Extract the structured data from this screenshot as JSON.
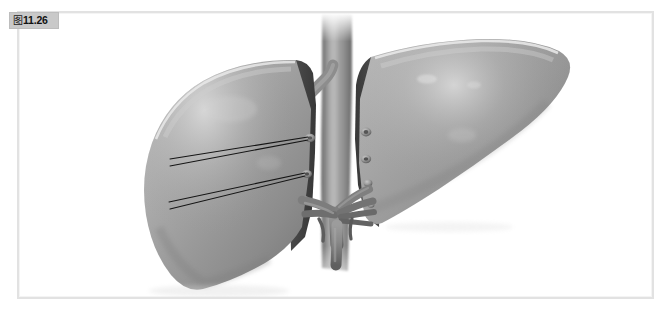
{
  "figure": {
    "badge_glyph": "图",
    "badge_number": "11.26",
    "badge_full": "图11.26",
    "caption": ""
  },
  "frame": {
    "border_color": "#e2e2e2",
    "background": "#ffffff",
    "badge_background": "#c9c9c9",
    "badge_text_color": "#111111"
  },
  "illustration": {
    "title": "bisected-liver-anatomy",
    "subject": "liver",
    "view": "bisected-posterior-view",
    "style": "grayscale-medical-illustration",
    "parts": [
      {
        "id": "left-lobe",
        "label": "left hepatic lobe",
        "tone": "#9b9b9b"
      },
      {
        "id": "right-lobe",
        "label": "right hepatic lobe",
        "tone": "#9b9b9b"
      },
      {
        "id": "left-lobe-cut-surface",
        "label": "left lobe resection surface",
        "tone": "#4c4c4c"
      },
      {
        "id": "right-lobe-cut-surface",
        "label": "right lobe resection surface",
        "tone": "#4c4c4c"
      },
      {
        "id": "inferior-vena-cava",
        "label": "inferior vena cava",
        "tone": "#8e8e8e"
      },
      {
        "id": "portal-vein-branch",
        "label": "portal vein branches",
        "tone": "#7d7d7d"
      },
      {
        "id": "hepatic-artery-branch",
        "label": "hepatic artery branches",
        "tone": "#757575"
      },
      {
        "id": "vessel-ostia",
        "label": "cut vessel openings",
        "tone": "#b4b4b4"
      },
      {
        "id": "leader-lines",
        "label": "anatomical pointer lines",
        "tone": "#1c1c1c"
      }
    ],
    "colors": {
      "parenchyma_light": "#c2c2c2",
      "parenchyma_mid": "#9b9b9b",
      "parenchyma_dark": "#6f6f6f",
      "cut_surface": "#4c4c4c",
      "cut_surface_dark": "#3a3a3a",
      "vessel": "#8a8a8a",
      "vessel_dark": "#5e5e5e",
      "highlight": "#e6e6e6",
      "leader_line": "#151515",
      "background": "#ffffff"
    },
    "leader_line_count": 4,
    "vessel_ostia_count": 7
  }
}
